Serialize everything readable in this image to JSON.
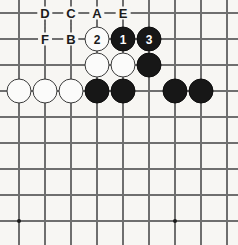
{
  "diagram": {
    "type": "go-board-diagram",
    "board": {
      "columns": 9,
      "rows": 9,
      "origin_x": 19,
      "origin_y": 13,
      "spacing_x": 26,
      "spacing_y": 26,
      "line_color": "#6f6f6f",
      "background_color": "#f7f6f3"
    },
    "star_points": [
      {
        "name": "star-point-lower-left",
        "col": 0,
        "row": 8
      },
      {
        "name": "star-point-lower-right",
        "col": 6,
        "row": 8
      }
    ],
    "stones": [
      {
        "name": "stone-white-move-2",
        "color": "white",
        "label": "2",
        "col": 3,
        "row": 1
      },
      {
        "name": "stone-black-move-1",
        "color": "black",
        "label": "1",
        "col": 4,
        "row": 1
      },
      {
        "name": "stone-black-move-3",
        "color": "black",
        "label": "3",
        "col": 5,
        "row": 1
      },
      {
        "name": "stone-white-c3r2",
        "color": "white",
        "label": "",
        "col": 3,
        "row": 2
      },
      {
        "name": "stone-white-c4r2",
        "color": "white",
        "label": "",
        "col": 4,
        "row": 2
      },
      {
        "name": "stone-black-c5r2",
        "color": "black",
        "label": "",
        "col": 5,
        "row": 2
      },
      {
        "name": "stone-white-c0r3",
        "color": "white",
        "label": "",
        "col": 0,
        "row": 3
      },
      {
        "name": "stone-white-c1r3",
        "color": "white",
        "label": "",
        "col": 1,
        "row": 3
      },
      {
        "name": "stone-white-c2r3",
        "color": "white",
        "label": "",
        "col": 2,
        "row": 3
      },
      {
        "name": "stone-black-c3r3",
        "color": "black",
        "label": "",
        "col": 3,
        "row": 3
      },
      {
        "name": "stone-black-c4r3",
        "color": "black",
        "label": "",
        "col": 4,
        "row": 3
      },
      {
        "name": "stone-black-c6r3",
        "color": "black",
        "label": "",
        "col": 6,
        "row": 3
      },
      {
        "name": "stone-black-c7r3",
        "color": "black",
        "label": "",
        "col": 7,
        "row": 3
      }
    ],
    "point_labels": [
      {
        "name": "point-label-d",
        "text": "D",
        "col": 1,
        "row": 0
      },
      {
        "name": "point-label-c",
        "text": "C",
        "col": 2,
        "row": 0
      },
      {
        "name": "point-label-a",
        "text": "A",
        "col": 3,
        "row": 0
      },
      {
        "name": "point-label-e",
        "text": "E",
        "col": 4,
        "row": 0
      },
      {
        "name": "point-label-f",
        "text": "F",
        "col": 1,
        "row": 1
      },
      {
        "name": "point-label-b",
        "text": "B",
        "col": 2,
        "row": 1
      }
    ]
  }
}
